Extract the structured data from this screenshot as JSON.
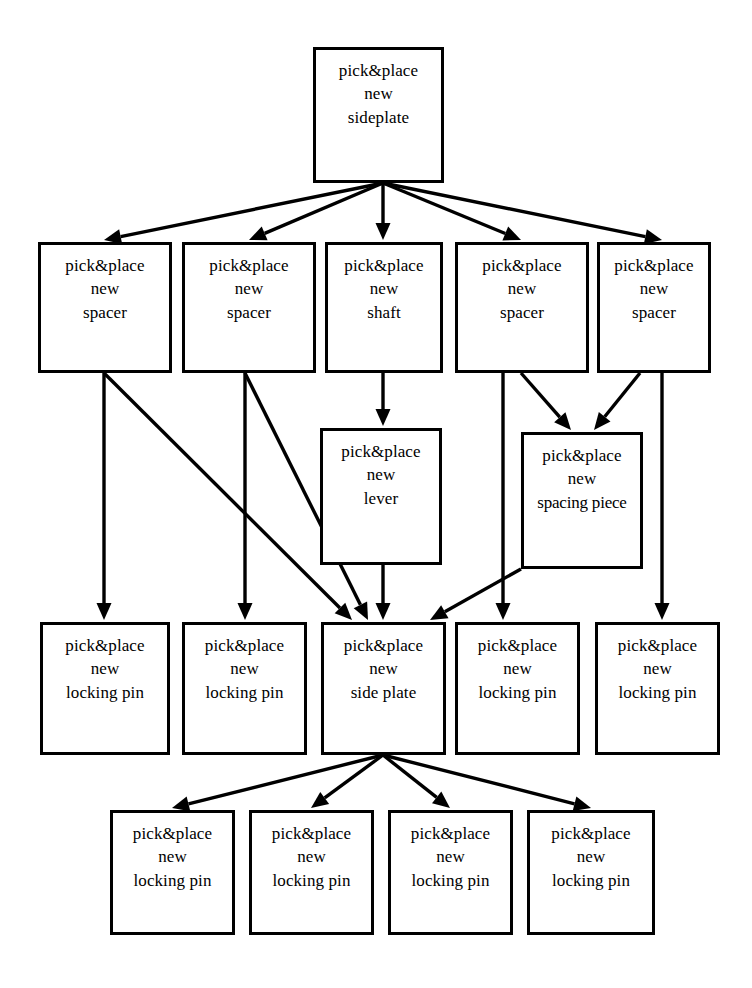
{
  "diagram": {
    "line_color": "#000000",
    "background_color": "#ffffff",
    "node_label_lines": {
      "l1": "pick&place",
      "l2": "new"
    },
    "nodes": [
      {
        "id": "n0",
        "row": 1,
        "line1": "pick&place",
        "line2": "new",
        "line3": "sideplate",
        "x": 313,
        "y": 47,
        "w": 131,
        "h": 136
      },
      {
        "id": "n1",
        "row": 2,
        "line1": "pick&place",
        "line2": "new",
        "line3": "spacer",
        "x": 38,
        "y": 242,
        "w": 134,
        "h": 131
      },
      {
        "id": "n2",
        "row": 2,
        "line1": "pick&place",
        "line2": "new",
        "line3": "spacer",
        "x": 182,
        "y": 242,
        "w": 134,
        "h": 131
      },
      {
        "id": "n3",
        "row": 2,
        "line1": "pick&place",
        "line2": "new",
        "line3": "shaft",
        "x": 325,
        "y": 242,
        "w": 118,
        "h": 131
      },
      {
        "id": "n4",
        "row": 2,
        "line1": "pick&place",
        "line2": "new",
        "line3": "spacer",
        "x": 455,
        "y": 242,
        "w": 134,
        "h": 131
      },
      {
        "id": "n5",
        "row": 2,
        "line1": "pick&place",
        "line2": "new",
        "line3": "spacer",
        "x": 597,
        "y": 242,
        "w": 114,
        "h": 131
      },
      {
        "id": "n6",
        "row": 3,
        "line1": "pick&place",
        "line2": "new",
        "line3": "lever",
        "x": 320,
        "y": 428,
        "w": 122,
        "h": 137
      },
      {
        "id": "n7",
        "row": 3,
        "line1": "pick&place",
        "line2": "new",
        "line3": "spacing piece",
        "x": 521,
        "y": 432,
        "w": 122,
        "h": 137,
        "overflow": true
      },
      {
        "id": "n8",
        "row": 4,
        "line1": "pick&place",
        "line2": "new",
        "line3": "locking pin",
        "x": 40,
        "y": 622,
        "w": 130,
        "h": 133
      },
      {
        "id": "n9",
        "row": 4,
        "line1": "pick&place",
        "line2": "new",
        "line3": "locking pin",
        "x": 182,
        "y": 622,
        "w": 125,
        "h": 133
      },
      {
        "id": "n10",
        "row": 4,
        "line1": "pick&place",
        "line2": "new",
        "line3": "side plate",
        "x": 321,
        "y": 622,
        "w": 125,
        "h": 133
      },
      {
        "id": "n11",
        "row": 4,
        "line1": "pick&place",
        "line2": "new",
        "line3": "locking pin",
        "x": 455,
        "y": 622,
        "w": 125,
        "h": 133
      },
      {
        "id": "n12",
        "row": 4,
        "line1": "pick&place",
        "line2": "new",
        "line3": "locking pin",
        "x": 595,
        "y": 622,
        "w": 125,
        "h": 133
      },
      {
        "id": "n13",
        "row": 5,
        "line1": "pick&place",
        "line2": "new",
        "line3": "locking pin",
        "x": 110,
        "y": 810,
        "w": 125,
        "h": 125
      },
      {
        "id": "n14",
        "row": 5,
        "line1": "pick&place",
        "line2": "new",
        "line3": "locking pin",
        "x": 249,
        "y": 810,
        "w": 125,
        "h": 125
      },
      {
        "id": "n15",
        "row": 5,
        "line1": "pick&place",
        "line2": "new",
        "line3": "locking pin",
        "x": 388,
        "y": 810,
        "w": 125,
        "h": 125
      },
      {
        "id": "n16",
        "row": 5,
        "line1": "pick&place",
        "line2": "new",
        "line3": "locking pin",
        "x": 527,
        "y": 810,
        "w": 128,
        "h": 125
      }
    ],
    "edges": [
      {
        "from": "n0",
        "to": "n1",
        "x1": 383,
        "y1": 183,
        "x2": 104,
        "y2": 240
      },
      {
        "from": "n0",
        "to": "n2",
        "x1": 383,
        "y1": 183,
        "x2": 249,
        "y2": 240
      },
      {
        "from": "n0",
        "to": "n3",
        "x1": 383,
        "y1": 183,
        "x2": 383,
        "y2": 240
      },
      {
        "from": "n0",
        "to": "n4",
        "x1": 383,
        "y1": 183,
        "x2": 521,
        "y2": 240
      },
      {
        "from": "n0",
        "to": "n5",
        "x1": 383,
        "y1": 183,
        "x2": 662,
        "y2": 240
      },
      {
        "from": "n1",
        "to": "n8",
        "x1": 104,
        "y1": 373,
        "x2": 104,
        "y2": 620
      },
      {
        "from": "n1",
        "to": "n10",
        "x1": 104,
        "y1": 373,
        "x2": 352,
        "y2": 620
      },
      {
        "from": "n2",
        "to": "n9",
        "x1": 245,
        "y1": 373,
        "x2": 245,
        "y2": 620
      },
      {
        "from": "n2",
        "to": "n10",
        "x1": 245,
        "y1": 373,
        "x2": 368,
        "y2": 620
      },
      {
        "from": "n3",
        "to": "n6",
        "x1": 383,
        "y1": 373,
        "x2": 383,
        "y2": 426
      },
      {
        "from": "n4",
        "to": "n7",
        "x1": 521,
        "y1": 373,
        "x2": 571,
        "y2": 430
      },
      {
        "from": "n4",
        "to": "n11",
        "x1": 503,
        "y1": 373,
        "x2": 503,
        "y2": 620
      },
      {
        "from": "n5",
        "to": "n7",
        "x1": 640,
        "y1": 373,
        "x2": 594,
        "y2": 430
      },
      {
        "from": "n5",
        "to": "n12",
        "x1": 662,
        "y1": 373,
        "x2": 662,
        "y2": 620
      },
      {
        "from": "n6",
        "to": "n10",
        "x1": 383,
        "y1": 565,
        "x2": 383,
        "y2": 620
      },
      {
        "from": "n7",
        "to": "n10",
        "x1": 521,
        "y1": 569,
        "x2": 430,
        "y2": 620
      },
      {
        "from": "n10",
        "to": "n13",
        "x1": 383,
        "y1": 755,
        "x2": 172,
        "y2": 808
      },
      {
        "from": "n10",
        "to": "n14",
        "x1": 383,
        "y1": 755,
        "x2": 311,
        "y2": 808
      },
      {
        "from": "n10",
        "to": "n15",
        "x1": 383,
        "y1": 755,
        "x2": 450,
        "y2": 808
      },
      {
        "from": "n10",
        "to": "n16",
        "x1": 383,
        "y1": 755,
        "x2": 591,
        "y2": 808
      }
    ]
  }
}
